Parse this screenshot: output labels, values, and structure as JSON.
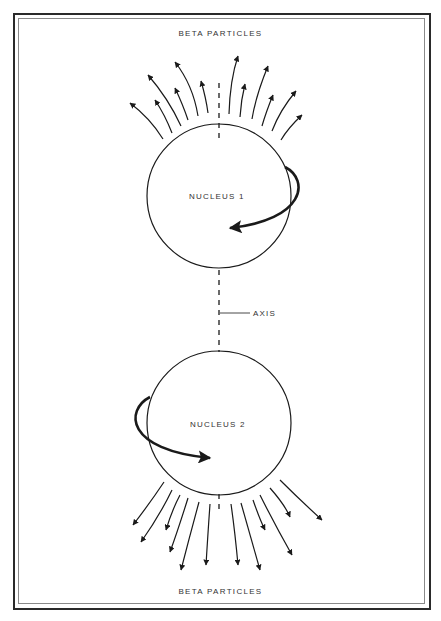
{
  "labels": {
    "top": "BETA PARTICLES",
    "bottom": "BETA PARTICLES",
    "nucleus1": "NUCLEUS 1",
    "nucleus2": "NUCLEUS 2",
    "axis": "AXIS"
  },
  "colors": {
    "stroke": "#1a1a1a",
    "frame_outer": "#2a2a2a",
    "frame_inner": "#8a8a8a",
    "text": "#333333"
  },
  "geometry": {
    "nucleus1": {
      "cx": 219,
      "cy": 196,
      "r": 72
    },
    "nucleus2": {
      "cx": 219,
      "cy": 423,
      "r": 72
    },
    "axis_x": 219,
    "axis_segments": [
      [
        83,
        140
      ],
      [
        270,
        352
      ],
      [
        494,
        513
      ]
    ],
    "axis_label_line": [
      220,
      313,
      250,
      313
    ]
  },
  "top_arrows": [
    "M163,139 Q150,118 130,103",
    "M172,133 Q165,115 155,100",
    "M181,126 Q168,98 148,75",
    "M188,120 Q183,105 175,88",
    "M198,116 Q193,85 175,62",
    "M208,113 Q206,98 201,81",
    "M229,114 Q230,80 238,56",
    "M240,117 Q241,100 245,84",
    "M252,119 Q256,95 268,66",
    "M262,126 Q266,112 273,95",
    "M272,131 Q280,110 296,91",
    "M281,140 Q288,128 302,115"
  ],
  "bottom_arrows": [
    "M164,482 Q150,503 133,525",
    "M172,490 Q160,515 141,542",
    "M180,495 Q172,510 166,530",
    "M188,498 Q178,530 170,552",
    "M199,502 Q190,535 181,570",
    "M210,504 Q208,532 206,565",
    "M231,504 Q235,532 238,565",
    "M241,503 Q250,535 260,570",
    "M253,500 Q260,520 265,530",
    "M260,495 Q275,525 292,555",
    "M270,488 Q285,505 290,517",
    "M280,480 Q300,500 322,520"
  ],
  "spin_arrows": {
    "nucleus1": "M285,167 C310,180 305,220 230,228",
    "nucleus2": "M150,397 C125,410 125,450 210,458"
  }
}
